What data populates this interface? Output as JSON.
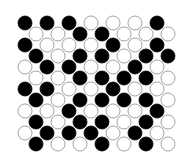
{
  "diagram": {
    "type": "staggered-circle-grid",
    "rows": 12,
    "cols": 7,
    "origin_x": 25,
    "origin_y": 23,
    "col_pitch": 22,
    "row_pitch": 11,
    "odd_row_offset": 11,
    "radius": 7,
    "colors": {
      "B": "#000000",
      "W": "#ffffff",
      "stroke": "#8a8a8a",
      "background": "#ffffff"
    },
    "pattern": [
      [
        "B",
        "B",
        "B",
        "W",
        "W",
        "W",
        "B"
      ],
      [
        "W",
        "W",
        "B",
        "B",
        "W",
        "W",
        "W"
      ],
      [
        "B",
        "W",
        "W",
        "W",
        "B",
        "W",
        "B"
      ],
      [
        "B",
        "W",
        "B",
        "B",
        "W",
        "B",
        "B"
      ],
      [
        "W",
        "B",
        "B",
        "W",
        "W",
        "B",
        "W"
      ],
      [
        "W",
        "W",
        "B",
        "B",
        "B",
        "B",
        "W"
      ],
      [
        "B",
        "B",
        "W",
        "W",
        "B",
        "W",
        "W"
      ],
      [
        "B",
        "W",
        "B",
        "B",
        "B",
        "B",
        "W"
      ],
      [
        "W",
        "W",
        "B",
        "W",
        "W",
        "W",
        "B"
      ],
      [
        "B",
        "W",
        "B",
        "B",
        "W",
        "B",
        "W"
      ],
      [
        "W",
        "B",
        "B",
        "B",
        "W",
        "B",
        "W"
      ],
      [
        "B",
        "W",
        "W",
        "B",
        "W",
        "B",
        "W"
      ]
    ]
  }
}
